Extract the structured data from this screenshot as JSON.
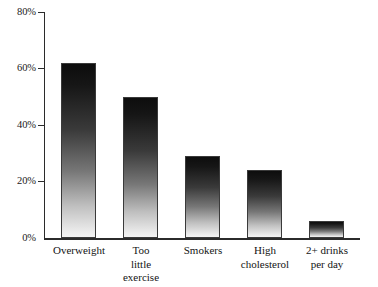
{
  "chart_data": {
    "type": "bar",
    "title": "",
    "subtitle": "",
    "xlabel": "",
    "ylabel": "",
    "categories": [
      "Overweight",
      "Too little exercise",
      "Smokers",
      "High cholesterol",
      "2+ drinks per day"
    ],
    "category_lines": [
      [
        "Overweight"
      ],
      [
        "Too",
        "little",
        "exercise"
      ],
      [
        "Smokers"
      ],
      [
        "High",
        "cholesterol"
      ],
      [
        "2+ drinks",
        "per day"
      ]
    ],
    "values": [
      62,
      50,
      29,
      24,
      6
    ],
    "ylim": [
      0,
      80
    ],
    "yticks": [
      0,
      20,
      40,
      60,
      80
    ],
    "ytick_labels": [
      "0%",
      "20%",
      "40%",
      "60%",
      "80%"
    ],
    "grid": false,
    "legend": null,
    "legend_position": "none",
    "bar_fill": "gradient-dark-top-to-light-bottom",
    "bar_edge_color": "#3a3a3a",
    "axis_color": "#2b2b2b",
    "background_color": "#ffffff"
  }
}
